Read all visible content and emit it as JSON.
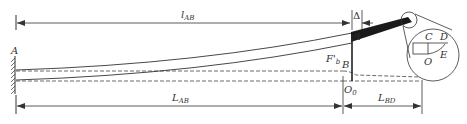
{
  "diagram": {
    "type": "cantilever beam deflection schematic",
    "colors": {
      "line": "#333333",
      "rod": "#1a1a1a",
      "dashed": "#444444"
    },
    "labels": {
      "A": "A",
      "B": "B",
      "O0_main": "O",
      "O0_sub": "0",
      "force_main": "F'",
      "force_sub": "b",
      "delta": "Δ",
      "C": "C",
      "D": "D",
      "E": "E",
      "O": "O"
    },
    "dimensions": {
      "top": {
        "main": "l",
        "sub": "AB"
      },
      "bottom_left": {
        "main": "L",
        "sub": "AB"
      },
      "bottom_right": {
        "main": "L",
        "sub": "BD"
      }
    }
  }
}
